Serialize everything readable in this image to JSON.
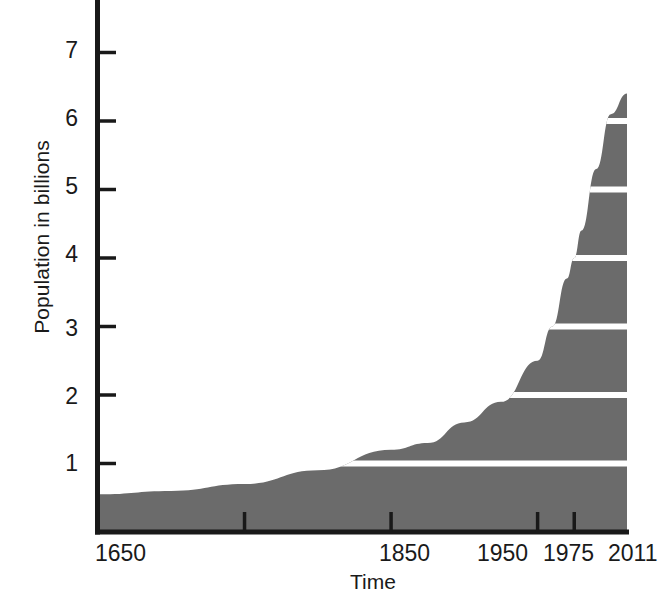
{
  "chart_data": {
    "type": "area",
    "title": "",
    "xlabel": "Time",
    "ylabel": "Population in billions",
    "x": [
      1650,
      1700,
      1750,
      1800,
      1850,
      1875,
      1900,
      1925,
      1950,
      1960,
      1970,
      1975,
      1980,
      1990,
      2000,
      2011
    ],
    "values": [
      0.55,
      0.6,
      0.7,
      0.9,
      1.2,
      1.3,
      1.6,
      1.9,
      2.5,
      3.0,
      3.7,
      4.0,
      4.4,
      5.3,
      6.1,
      6.4
    ],
    "series": [
      {
        "name": "World population",
        "values": [
          0.55,
          0.6,
          0.7,
          0.9,
          1.2,
          1.3,
          1.6,
          1.9,
          2.5,
          3.0,
          3.7,
          4.0,
          4.4,
          5.3,
          6.1,
          6.4
        ]
      }
    ],
    "xlim": [
      1650,
      2011
    ],
    "ylim": [
      0,
      7.6
    ],
    "x_tick_labels": [
      "1650",
      "1850",
      "1950",
      "1975",
      "2011"
    ],
    "x_tick_values": [
      1650,
      1850,
      1950,
      1975,
      2011
    ],
    "x_unlabeled_ticks": [
      1750
    ],
    "y_tick_labels": [
      "1",
      "2",
      "3",
      "4",
      "5",
      "6",
      "7"
    ],
    "y_tick_values": [
      1,
      2,
      3,
      4,
      5,
      6,
      7
    ],
    "grid": false,
    "legend": "none",
    "fill_color": "#6b6b6b",
    "stripe_color": "#ffffff",
    "axis_color": "#191919",
    "stripe_levels": [
      1,
      2,
      3,
      4,
      5,
      6
    ],
    "peak_value": 6.4,
    "peak_year": 2011
  },
  "axes": {
    "y_title": "Population in billions",
    "x_title": "Time",
    "y_ticks": [
      {
        "label": "7",
        "value": 7
      },
      {
        "label": "6",
        "value": 6
      },
      {
        "label": "5",
        "value": 5
      },
      {
        "label": "4",
        "value": 4
      },
      {
        "label": "3",
        "value": 3
      },
      {
        "label": "2",
        "value": 2
      },
      {
        "label": "1",
        "value": 1
      }
    ],
    "x_ticks": [
      {
        "label": "1650",
        "value": 1650
      },
      {
        "label": "1850",
        "value": 1850
      },
      {
        "label": "1950",
        "value": 1950
      },
      {
        "label": "1975",
        "value": 1975
      },
      {
        "label": "2011",
        "value": 2011
      }
    ]
  }
}
